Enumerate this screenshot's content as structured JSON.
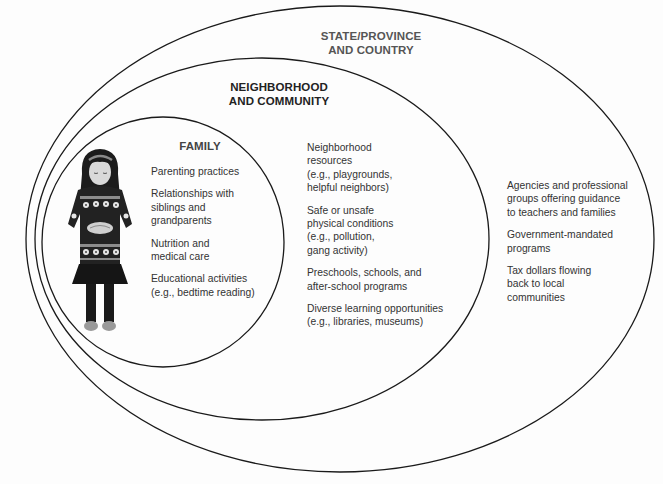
{
  "diagram": {
    "type": "nested-ecological-circles",
    "colors": {
      "stroke": "#1a1a1a",
      "background": "#fdfdfd",
      "text": "#333333"
    },
    "illustration": {
      "name": "girl-in-patterned-sweater",
      "description": "Child looking down holding hands in front, wearing a snowflake/flower patterned sweater, skirt, dark tights and shoes"
    },
    "rings": [
      {
        "id": "family",
        "title_lines": [
          "FAMILY"
        ],
        "items": [
          {
            "lines": [
              "Parenting practices"
            ]
          },
          {
            "lines": [
              "Relationships with",
              "siblings and",
              "grandparents"
            ]
          },
          {
            "lines": [
              "Nutrition and",
              "medical care"
            ]
          },
          {
            "lines": [
              "Educational activities",
              "(e.g., bedtime reading)"
            ]
          }
        ]
      },
      {
        "id": "neighborhood",
        "title_lines": [
          "NEIGHBORHOOD",
          "AND COMMUNITY"
        ],
        "items": [
          {
            "lines": [
              "Neighborhood",
              "resources",
              "(e.g., playgrounds,",
              "helpful neighbors)"
            ]
          },
          {
            "lines": [
              "Safe or unsafe",
              "physical conditions",
              "(e.g., pollution,",
              "gang activity)"
            ]
          },
          {
            "lines": [
              "Preschools, schools, and",
              "after-school programs"
            ]
          },
          {
            "lines": [
              "Diverse learning opportunities",
              "(e.g., libraries, museums)"
            ]
          }
        ]
      },
      {
        "id": "state",
        "title_lines": [
          "STATE/PROVINCE",
          "AND COUNTRY"
        ],
        "items": [
          {
            "lines": [
              "Agencies and professional",
              "groups offering guidance",
              "to teachers and families"
            ]
          },
          {
            "lines": [
              "Government-mandated",
              "programs"
            ]
          },
          {
            "lines": [
              "Tax dollars flowing",
              "back to local",
              "communities"
            ]
          }
        ]
      }
    ]
  }
}
